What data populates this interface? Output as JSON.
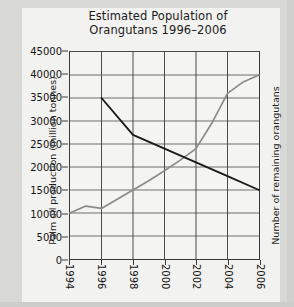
{
  "chart_data": {
    "type": "line",
    "title_line1": "Estimated Population of",
    "title_line2": "Orangutans 1996–2006",
    "xlabel": "",
    "ylabel": "Palm oil production (million tonnes)",
    "ylabel_right": "Number of remaining orangutans",
    "ylim": [
      0,
      45000
    ],
    "xlim": [
      1994,
      2006
    ],
    "grid": true,
    "legend_position": "none",
    "ytick_labels": [
      "45000",
      "40000",
      "35000",
      "30000",
      "25000",
      "20000",
      "15000",
      "10000",
      "5000",
      "0"
    ],
    "ytick_values": [
      45000,
      40000,
      35000,
      30000,
      25000,
      20000,
      15000,
      10000,
      5000,
      0
    ],
    "xtick_labels": [
      "1994",
      "1996",
      "1998",
      "2000",
      "2002",
      "2004",
      "2006"
    ],
    "xtick_values": [
      1994,
      1996,
      1998,
      2000,
      2002,
      2004,
      2006
    ],
    "series": [
      {
        "name": "Palm oil production (million tonnes)",
        "color": "#8a8a8a",
        "axis": "left",
        "x": [
          1994,
          1995,
          1996,
          1997,
          1998,
          1999,
          2000,
          2001,
          2002,
          2003,
          2004,
          2005,
          2006
        ],
        "values": [
          10000,
          11500,
          11000,
          13000,
          15000,
          17000,
          19200,
          21500,
          24000,
          29500,
          36000,
          38500,
          40000
        ]
      },
      {
        "name": "Number of remaining orangutans",
        "color": "#1a1a1a",
        "axis": "right",
        "x": [
          1996,
          1998,
          2000,
          2002,
          2004,
          2006
        ],
        "values": [
          35000,
          27000,
          24000,
          21000,
          18000,
          15000
        ]
      }
    ]
  }
}
